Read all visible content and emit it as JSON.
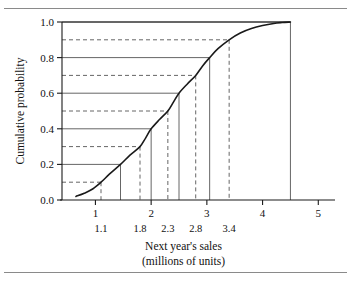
{
  "figure": {
    "has_top_rule": true,
    "has_bottom_rule": true,
    "background": "#ffffff",
    "line_color": "#1a1a1a",
    "grid_color": "#555555"
  },
  "chart_data": {
    "type": "line",
    "title": "",
    "xlabel": "Next year's sales",
    "xlabel_line2": "(millions of units)",
    "ylabel": "Cumulative probability",
    "xlim": [
      0.4,
      5.3
    ],
    "ylim": [
      0.0,
      1.0
    ],
    "grid": true,
    "legend": "none",
    "x_ticks": [
      "1",
      "2",
      "3",
      "4",
      "5"
    ],
    "x_tick_values": [
      1,
      2,
      3,
      4,
      5
    ],
    "x_minor_tick_values": [
      1.1,
      1.45,
      1.8,
      2.15,
      2.3,
      2.5,
      2.8,
      3.05,
      3.4,
      4.5
    ],
    "y_ticks": [
      "0.0",
      "0.2",
      "0.4",
      "0.6",
      "0.8",
      "1.0"
    ],
    "y_tick_values": [
      0.0,
      0.2,
      0.4,
      0.6,
      0.8,
      1.0
    ],
    "solid_gridlines_y": [
      0.2,
      0.4,
      0.6,
      0.8,
      1.0
    ],
    "dashed_gridlines_y": [
      0.1,
      0.3,
      0.5,
      0.7,
      0.9
    ],
    "decile_labels": [
      "1.1",
      "1.8",
      "2.3",
      "2.8",
      "3.4"
    ],
    "decile_label_values": [
      1.1,
      1.8,
      2.3,
      2.8,
      3.4
    ],
    "deciles": [
      {
        "p": 0.1,
        "x": 1.1,
        "style": "dashed"
      },
      {
        "p": 0.2,
        "x": 1.45,
        "style": "solid"
      },
      {
        "p": 0.3,
        "x": 1.8,
        "style": "dashed"
      },
      {
        "p": 0.4,
        "x": 2.0,
        "style": "solid"
      },
      {
        "p": 0.5,
        "x": 2.3,
        "style": "dashed"
      },
      {
        "p": 0.6,
        "x": 2.5,
        "style": "solid"
      },
      {
        "p": 0.7,
        "x": 2.8,
        "style": "dashed"
      },
      {
        "p": 0.8,
        "x": 3.05,
        "style": "solid"
      },
      {
        "p": 0.9,
        "x": 3.4,
        "style": "dashed"
      },
      {
        "p": 1.0,
        "x": 4.5,
        "style": "solid"
      }
    ],
    "curve": {
      "name": "Cumulative distribution",
      "x": [
        0.65,
        0.8,
        0.95,
        1.1,
        1.25,
        1.45,
        1.62,
        1.8,
        1.9,
        2.0,
        2.15,
        2.3,
        2.4,
        2.5,
        2.65,
        2.8,
        2.92,
        3.05,
        3.2,
        3.4,
        3.6,
        3.8,
        4.0,
        4.2,
        4.35,
        4.5
      ],
      "y": [
        0.02,
        0.038,
        0.062,
        0.1,
        0.145,
        0.2,
        0.252,
        0.3,
        0.348,
        0.4,
        0.452,
        0.5,
        0.55,
        0.6,
        0.652,
        0.7,
        0.752,
        0.8,
        0.85,
        0.9,
        0.938,
        0.963,
        0.98,
        0.992,
        0.997,
        1.0
      ]
    }
  }
}
